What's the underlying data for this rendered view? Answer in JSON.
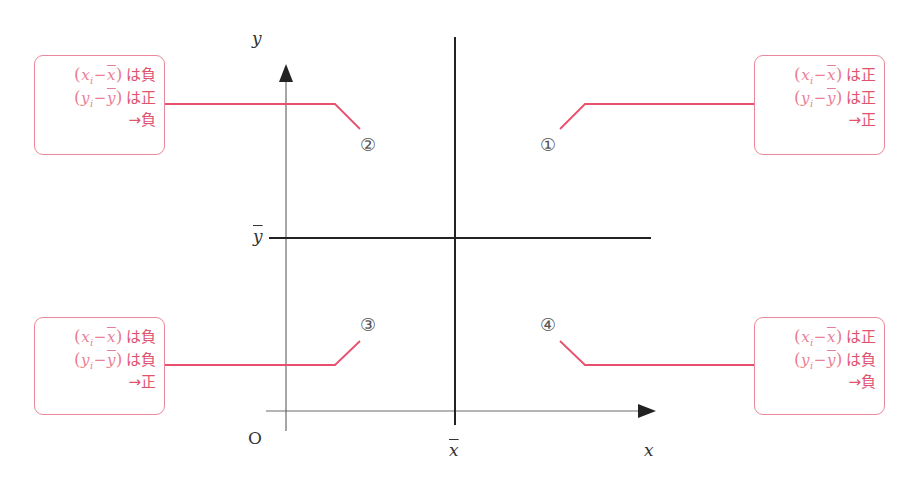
{
  "diagram": {
    "type": "covariance-quadrants",
    "axes": {
      "x_label": "x",
      "y_label": "y",
      "origin_label": "O",
      "x_mean_label": "x",
      "y_mean_label": "y"
    },
    "quadrants": [
      {
        "id": "1",
        "symbol": "①",
        "x_dev_label": "x",
        "x_dev_sub": "i",
        "x_bar": "x",
        "x_sign": "は正",
        "y_dev_label": "y",
        "y_dev_sub": "i",
        "y_bar": "y",
        "y_sign": "は正",
        "result": "→正"
      },
      {
        "id": "2",
        "symbol": "②",
        "x_dev_label": "x",
        "x_dev_sub": "i",
        "x_bar": "x",
        "x_sign": "は負",
        "y_dev_label": "y",
        "y_dev_sub": "i",
        "y_bar": "y",
        "y_sign": "は正",
        "result": "→負"
      },
      {
        "id": "3",
        "symbol": "③",
        "x_dev_label": "x",
        "x_dev_sub": "i",
        "x_bar": "x",
        "x_sign": "は負",
        "y_dev_label": "y",
        "y_dev_sub": "i",
        "y_bar": "y",
        "y_sign": "は負",
        "result": "→正"
      },
      {
        "id": "4",
        "symbol": "④",
        "x_dev_label": "x",
        "x_dev_sub": "i",
        "x_bar": "x",
        "x_sign": "は正",
        "y_dev_label": "y",
        "y_dev_sub": "i",
        "y_bar": "y",
        "y_sign": "は負",
        "result": "→負"
      }
    ],
    "operators": {
      "open": "(",
      "minus": "−",
      "close": ")"
    },
    "colors": {
      "accent": "#e8506e",
      "box_border": "#e8889a",
      "axis": "#555555",
      "mean_line": "#222222"
    }
  }
}
